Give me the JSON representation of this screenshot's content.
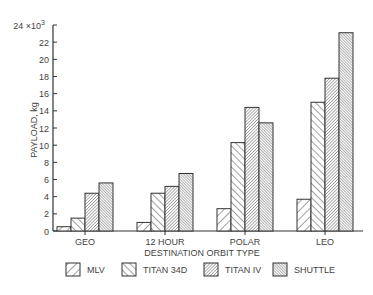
{
  "chart_data": {
    "type": "bar",
    "title": "",
    "xlabel": "DESTINATION ORBIT TYPE",
    "ylabel": "PAYLOAD, kg",
    "y_multiplier_label": "×10³",
    "ylim": [
      0,
      24
    ],
    "yticks": [
      0,
      2,
      4,
      6,
      8,
      10,
      12,
      14,
      16,
      18,
      20,
      22,
      24
    ],
    "ytick_top_label": "24 ×10³",
    "grid": false,
    "legend_position": "bottom",
    "categories": [
      "GEO",
      "12 HOUR",
      "POLAR",
      "LEO"
    ],
    "series": [
      {
        "name": "MLV",
        "pattern": "light-forward-hatch",
        "values": [
          0.5,
          1.0,
          2.6,
          3.7
        ]
      },
      {
        "name": "TITAN 34D",
        "pattern": "back-hatch",
        "values": [
          1.5,
          4.4,
          10.3,
          15.0
        ]
      },
      {
        "name": "TITAN IV",
        "pattern": "dense-forward-hatch",
        "values": [
          4.4,
          5.2,
          14.4,
          17.8
        ]
      },
      {
        "name": "SHUTTLE",
        "pattern": "dense-back-hatch",
        "values": [
          5.6,
          6.7,
          12.6,
          23.1
        ]
      }
    ]
  },
  "colors": {
    "ink": "#333333",
    "background": "#ffffff"
  }
}
